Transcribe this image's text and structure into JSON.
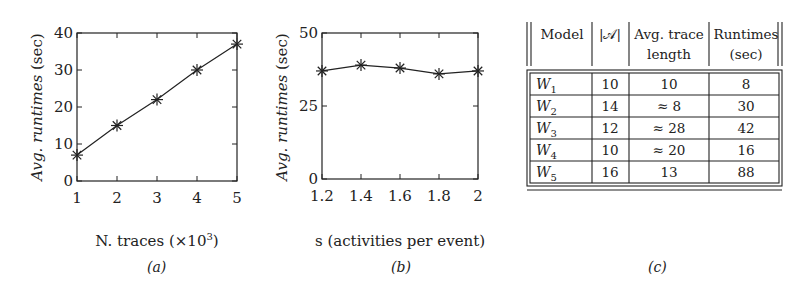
{
  "chart_data": [
    {
      "type": "line",
      "id": "a",
      "caption": "(a)",
      "title": "",
      "xlabel": "N. traces (×10",
      "xlabel_sup": "3",
      "xlabel_close": ")",
      "ylabel_prefix": "Avg. ",
      "ylabel_italic": "runtimes",
      "ylabel_suffix": " (sec)",
      "x": [
        1,
        2,
        3,
        4,
        5
      ],
      "series": [
        {
          "name": "runtime",
          "values": [
            7,
            15,
            22,
            30,
            37
          ],
          "marker": "asterisk"
        }
      ],
      "xticks": [
        "1",
        "2",
        "3",
        "4",
        "5"
      ],
      "yticks": [
        "0",
        "10",
        "20",
        "30",
        "40"
      ],
      "xlim": [
        1,
        5
      ],
      "ylim": [
        0,
        40
      ],
      "grid": false
    },
    {
      "type": "line",
      "id": "b",
      "caption": "(b)",
      "title": "",
      "xlabel": "s (activities per event)",
      "ylabel_prefix": "Avg. ",
      "ylabel_italic": "runtimes",
      "ylabel_suffix": " (sec)",
      "x": [
        1.2,
        1.4,
        1.6,
        1.8,
        2
      ],
      "series": [
        {
          "name": "runtime",
          "values": [
            37,
            39,
            38,
            36,
            37
          ],
          "marker": "asterisk"
        }
      ],
      "xticks": [
        "1.2",
        "1.4",
        "1.6",
        "1.8",
        "2"
      ],
      "yticks": [
        "0",
        "25",
        "50"
      ],
      "xlim": [
        1.2,
        2
      ],
      "ylim": [
        0,
        50
      ],
      "grid": false
    }
  ],
  "table": {
    "caption": "(c)",
    "headers": {
      "model": "Model",
      "activities": "|𝒜|",
      "avg_trace_line1": "Avg. trace",
      "avg_trace_line2": "length",
      "runtimes_line1": "Runtimes",
      "runtimes_line2": "(sec)"
    },
    "rows": [
      {
        "model": "W",
        "sub": "1",
        "activities": "10",
        "avg_trace": "10",
        "runtime": "8"
      },
      {
        "model": "W",
        "sub": "2",
        "activities": "14",
        "avg_trace": "≈ 8",
        "runtime": "30"
      },
      {
        "model": "W",
        "sub": "3",
        "activities": "12",
        "avg_trace": "≈ 28",
        "runtime": "42"
      },
      {
        "model": "W",
        "sub": "4",
        "activities": "10",
        "avg_trace": "≈ 20",
        "runtime": "16"
      },
      {
        "model": "W",
        "sub": "5",
        "activities": "16",
        "avg_trace": "13",
        "runtime": "88"
      }
    ]
  }
}
